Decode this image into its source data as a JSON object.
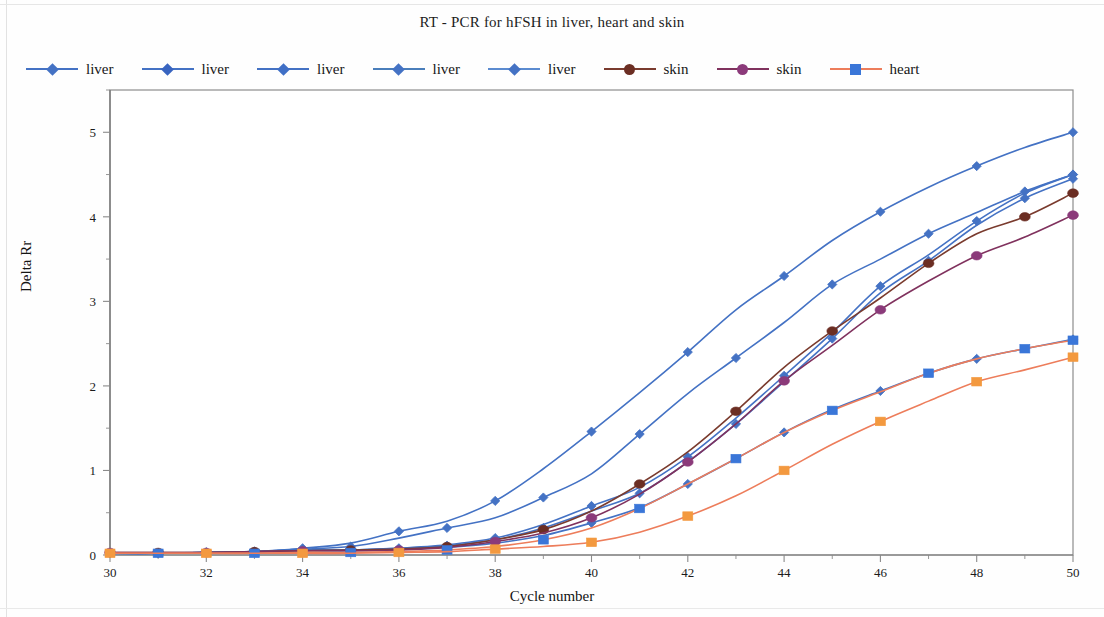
{
  "figure": {
    "title": "RT  - PCR for hFSH in liver, heart and skin",
    "x_axis_title": "Cycle number",
    "y_axis_title": "Delta Rr"
  },
  "legend": {
    "items": [
      {
        "label": "liver",
        "marker": "diamond-icon",
        "line_color": "#4472C4",
        "marker_color": "#4472C4"
      },
      {
        "label": "liver",
        "marker": "diamond-icon",
        "line_color": "#4472C4",
        "marker_color": "#3864C0"
      },
      {
        "label": "liver",
        "marker": "diamond-icon",
        "line_color": "#4472C4",
        "marker_color": "#3F6FC6"
      },
      {
        "label": "liver",
        "marker": "diamond-icon",
        "line_color": "#4A7EBB",
        "marker_color": "#4472C4"
      },
      {
        "label": "liver",
        "marker": "diamond-icon",
        "line_color": "#5B8BD0",
        "marker_color": "#4472C4"
      },
      {
        "label": "skin",
        "marker": "circle-icon",
        "line_color": "#7A3B2E",
        "marker_color": "#6B2E23"
      },
      {
        "label": "skin",
        "marker": "circle-icon",
        "line_color": "#80325E",
        "marker_color": "#8B3A7A"
      },
      {
        "label": "heart",
        "marker": "square-icon",
        "line_color": "#ED7D5B",
        "marker_color": "#3A76D8"
      }
    ]
  },
  "chart_data": {
    "type": "line",
    "title": "RT  - PCR for hFSH in liver, heart and skin",
    "xlabel": "Cycle number",
    "ylabel": "Delta Rr",
    "xlim": [
      30,
      50
    ],
    "ylim": [
      0,
      5.5
    ],
    "xticks": [
      30,
      32,
      34,
      36,
      38,
      40,
      42,
      44,
      46,
      48,
      50
    ],
    "yticks": [
      0,
      1,
      2,
      3,
      4,
      5
    ],
    "x_minor_step": 1,
    "y_minor_step": 0.5,
    "grid": false,
    "legend_position": "top",
    "x": [
      30,
      31,
      32,
      33,
      34,
      35,
      36,
      37,
      38,
      39,
      40,
      41,
      42,
      43,
      44,
      45,
      46,
      47,
      48,
      49,
      50
    ],
    "series": [
      {
        "name": "liver",
        "id": "liver-1",
        "color": "#4472C4",
        "marker": "diamond",
        "marker_color": "#4472C4",
        "values": [
          0.02,
          0.02,
          0.03,
          0.04,
          0.08,
          0.14,
          0.28,
          0.4,
          0.64,
          1.02,
          1.46,
          1.92,
          2.4,
          2.9,
          3.3,
          3.72,
          4.06,
          4.35,
          4.6,
          4.82,
          5.0
        ]
      },
      {
        "name": "liver",
        "id": "liver-2",
        "color": "#4472C4",
        "marker": "diamond",
        "marker_color": "#4472C4",
        "values": [
          0.02,
          0.02,
          0.03,
          0.04,
          0.07,
          0.1,
          0.2,
          0.32,
          0.44,
          0.68,
          0.96,
          1.43,
          1.91,
          2.33,
          2.75,
          3.2,
          3.5,
          3.8,
          4.05,
          4.3,
          4.5
        ]
      },
      {
        "name": "liver",
        "id": "liver-3",
        "color": "#4472C4",
        "marker": "diamond",
        "marker_color": "#4472C4",
        "values": [
          0.02,
          0.02,
          0.03,
          0.04,
          0.06,
          0.06,
          0.08,
          0.12,
          0.2,
          0.36,
          0.58,
          0.8,
          1.16,
          1.62,
          2.12,
          2.63,
          3.18,
          3.55,
          3.95,
          4.28,
          4.5
        ]
      },
      {
        "name": "liver",
        "id": "liver-4",
        "color": "#4472C4",
        "marker": "diamond",
        "marker_color": "#4472C4",
        "values": [
          0.02,
          0.02,
          0.03,
          0.04,
          0.06,
          0.06,
          0.08,
          0.11,
          0.18,
          0.32,
          0.52,
          0.73,
          1.1,
          1.55,
          2.05,
          2.56,
          3.1,
          3.48,
          3.9,
          4.22,
          4.45
        ]
      },
      {
        "name": "liver",
        "id": "liver-5",
        "color": "#4472C4",
        "marker": "diamond",
        "marker_color": "#4472C4",
        "values": [
          0.02,
          0.02,
          0.03,
          0.03,
          0.05,
          0.05,
          0.07,
          0.09,
          0.14,
          0.23,
          0.38,
          0.56,
          0.84,
          1.14,
          1.45,
          1.72,
          1.94,
          2.15,
          2.32,
          2.44,
          2.55
        ]
      },
      {
        "name": "skin",
        "id": "skin-1",
        "color": "#7A3B2E",
        "marker": "circle",
        "marker_color": "#6B2E23",
        "values": [
          0.03,
          0.03,
          0.03,
          0.04,
          0.05,
          0.06,
          0.07,
          0.1,
          0.18,
          0.3,
          0.52,
          0.84,
          1.22,
          1.7,
          2.22,
          2.65,
          3.04,
          3.45,
          3.8,
          4.0,
          4.28
        ]
      },
      {
        "name": "skin",
        "id": "skin-2",
        "color": "#80325E",
        "marker": "circle",
        "marker_color": "#8B3A7A",
        "values": [
          0.03,
          0.03,
          0.03,
          0.04,
          0.05,
          0.05,
          0.06,
          0.09,
          0.16,
          0.26,
          0.44,
          0.72,
          1.1,
          1.55,
          2.06,
          2.48,
          2.9,
          3.24,
          3.54,
          3.76,
          4.02
        ]
      },
      {
        "name": "heart",
        "id": "heart-1",
        "color": "#ED7D5B",
        "marker": "square",
        "marker_color": "#3A76D8",
        "values": [
          0.02,
          0.02,
          0.02,
          0.02,
          0.03,
          0.03,
          0.04,
          0.06,
          0.1,
          0.18,
          0.32,
          0.55,
          0.84,
          1.14,
          1.45,
          1.71,
          1.93,
          2.15,
          2.32,
          2.44,
          2.54
        ]
      },
      {
        "name": "heart",
        "id": "heart-2",
        "color": "#ED7D5B",
        "marker": "square",
        "marker_color": "#F3993F",
        "values": [
          0.02,
          0.02,
          0.02,
          0.02,
          0.02,
          0.02,
          0.03,
          0.04,
          0.07,
          0.1,
          0.15,
          0.27,
          0.46,
          0.7,
          1.0,
          1.31,
          1.58,
          1.82,
          2.05,
          2.19,
          2.34
        ]
      }
    ]
  }
}
